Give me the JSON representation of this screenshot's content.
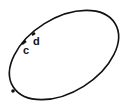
{
  "diagram": {
    "shape": "ellipse",
    "stroke_color": "#111111",
    "background": "#ffffff",
    "labels": [
      {
        "id": "c",
        "text": "c"
      },
      {
        "id": "d",
        "text": "d"
      }
    ]
  }
}
